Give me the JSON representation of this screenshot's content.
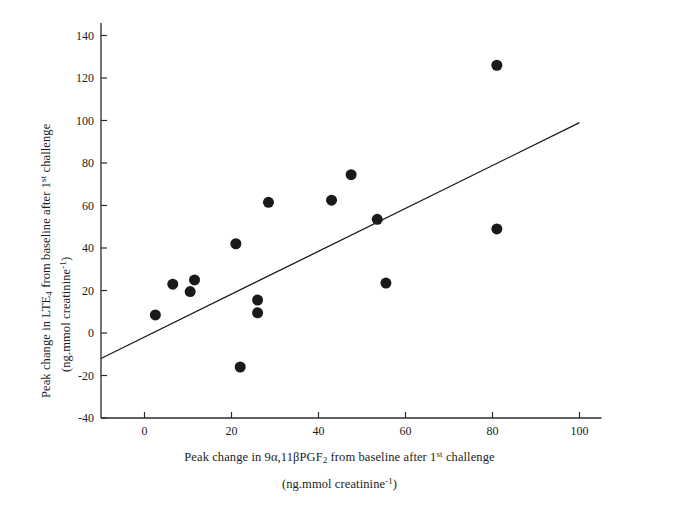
{
  "chart_data": {
    "type": "scatter",
    "title": "",
    "xlabel_line1_html": "Peak change in 9α,11βPGF<sub>2</sub> from baseline after 1<sup>st</sup> challenge",
    "xlabel_line2_html": "(ng.mmol creatinine<sup>-1</sup>)",
    "ylabel_line1_html": "Peak change in LTE<sub>4</sub> from baseline after 1<sup>st</sup> challenge",
    "ylabel_line2_html": "(ng.mmol creatinine<sup>-1</sup>)",
    "xlabel_plain": "Peak change in 9a,11bPGF2 from baseline after 1st challenge (ng.mmol creatinine-1)",
    "ylabel_plain": "Peak change in LTE4 from baseline after 1st challenge (ng.mmol creatinine-1)",
    "xlim": [
      -10,
      100
    ],
    "ylim": [
      -40,
      145
    ],
    "xticks": [
      0,
      20,
      40,
      60,
      80,
      100
    ],
    "yticks": [
      -40,
      -20,
      0,
      20,
      40,
      60,
      80,
      100,
      120,
      140
    ],
    "xtick_labels": [
      "0",
      "20",
      "40",
      "60",
      "80",
      "100"
    ],
    "ytick_labels": [
      "-40",
      "-20",
      "0",
      "20",
      "40",
      "60",
      "80",
      "100",
      "120",
      "140"
    ],
    "grid": false,
    "legend": null,
    "marker": {
      "shape": "circle",
      "color": "#1a1a1a",
      "size_px": 11
    },
    "points": [
      {
        "x": 2.5,
        "y": 8.5
      },
      {
        "x": 6.5,
        "y": 23.0
      },
      {
        "x": 10.5,
        "y": 19.5
      },
      {
        "x": 11.5,
        "y": 25.0
      },
      {
        "x": 21.0,
        "y": 42.0
      },
      {
        "x": 22.0,
        "y": -16.0
      },
      {
        "x": 26.0,
        "y": 15.5
      },
      {
        "x": 26.0,
        "y": 9.5
      },
      {
        "x": 28.5,
        "y": 61.5
      },
      {
        "x": 43.0,
        "y": 62.5
      },
      {
        "x": 47.5,
        "y": 74.5
      },
      {
        "x": 53.5,
        "y": 53.5
      },
      {
        "x": 55.5,
        "y": 23.5
      },
      {
        "x": 81.0,
        "y": 126.0
      },
      {
        "x": 81.0,
        "y": 49.0
      }
    ],
    "fit_line": {
      "type": "linear-regression",
      "color": "#1a1a1a",
      "x_start": -10,
      "y_start": -12.0,
      "x_end": 100,
      "y_end": 99.0
    },
    "axis_color": "#2b2b2b",
    "background": "#ffffff"
  }
}
